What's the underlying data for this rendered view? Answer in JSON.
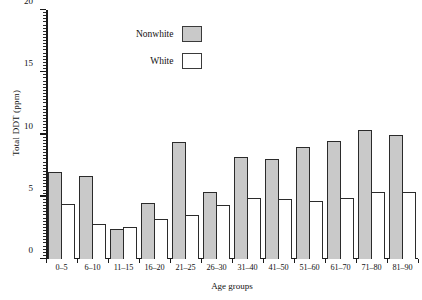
{
  "chart_data": {
    "type": "bar",
    "title": "",
    "xlabel": "Age groups",
    "ylabel": "Total DDT (ppm)",
    "categories": [
      "0–5",
      "6–10",
      "11–15",
      "16–20",
      "21–25",
      "26–30",
      "31–40",
      "41–50",
      "51–60",
      "61–70",
      "71–80",
      "81–90"
    ],
    "series": [
      {
        "name": "Nonwhite",
        "color": "#c9c9c9",
        "values": [
          7.0,
          6.7,
          2.4,
          4.5,
          9.4,
          5.4,
          8.2,
          8.0,
          9.0,
          9.5,
          10.4,
          10.0
        ]
      },
      {
        "name": "White",
        "color": "#ffffff",
        "values": [
          4.4,
          2.8,
          2.6,
          3.2,
          3.5,
          4.3,
          4.9,
          4.8,
          4.7,
          4.9,
          5.4,
          5.4
        ]
      }
    ],
    "ylim": [
      0,
      20
    ],
    "ytick_labels": [
      "0",
      "5",
      "10",
      "15",
      "20"
    ],
    "ytick_values": [
      0,
      5,
      10,
      15,
      20
    ],
    "minor_tick_step": 0.25,
    "grid": false,
    "legend_position": "top-center",
    "legend": [
      {
        "label": "Nonwhite",
        "swatch": "gray"
      },
      {
        "label": "White",
        "swatch": "white"
      }
    ]
  }
}
